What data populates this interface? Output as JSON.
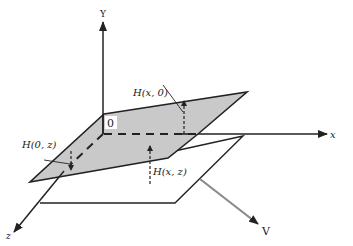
{
  "diagram": {
    "axes": {
      "y_label": "Y",
      "x_label": "x",
      "z_label": "z",
      "origin_label": "0"
    },
    "annotations": {
      "h_x0": "H(x, 0)",
      "h_0z": "H(0, z)",
      "h_xz": "H(x, z)",
      "velocity": "V"
    },
    "colors": {
      "plane_fill": "#c9c9c9",
      "line": "#222222",
      "velocity_arrow": "#8a8a8a"
    }
  }
}
